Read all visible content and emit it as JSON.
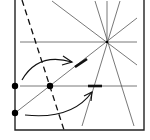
{
  "diagram": {
    "type": "origami-crease-diagram",
    "colors": {
      "background": "#ffffff",
      "frame": "#222222",
      "crease": "#555555",
      "fold_line": "#111111",
      "point": "#000000",
      "arrow": "#111111"
    },
    "frame": {
      "x1": 15,
      "y1": 0,
      "x2": 144,
      "y2": 130
    },
    "star_center": {
      "x": 107,
      "y": 42
    },
    "horizontal_lines": [
      {
        "name": "upper-horizontal-crease",
        "x1": 20,
        "y1": 42,
        "x2": 137,
        "y2": 42
      },
      {
        "name": "lower-horizontal-crease",
        "x1": 20,
        "y1": 86,
        "x2": 137,
        "y2": 86
      }
    ],
    "star_rays": [
      {
        "x1": 52,
        "y1": 1,
        "x2": 137,
        "y2": 65
      },
      {
        "x1": 137,
        "y1": 18,
        "x2": 15,
        "y2": 113
      },
      {
        "x1": 95,
        "y1": 1,
        "x2": 134,
        "y2": 126
      },
      {
        "x1": 120,
        "y1": 1,
        "x2": 82,
        "y2": 126
      },
      {
        "x1": 107,
        "y1": 1,
        "x2": 107,
        "y2": 42
      }
    ],
    "dashed_fold": {
      "x1": 22,
      "y1": 0,
      "x2": 64,
      "y2": 130
    },
    "points": [
      {
        "name": "left-upper-point",
        "x": 15,
        "y": 86
      },
      {
        "name": "left-lower-point",
        "x": 15,
        "y": 113
      },
      {
        "name": "intersection-point",
        "x": 50,
        "y": 86
      }
    ],
    "target_marks": [
      {
        "name": "diagonal-target-mark",
        "x1": 75,
        "y1": 67,
        "x2": 87,
        "y2": 59
      },
      {
        "name": "horizontal-target-mark",
        "x1": 88,
        "y1": 86,
        "x2": 102,
        "y2": 86
      }
    ],
    "arrows": [
      {
        "name": "upper-swing-arrow",
        "path": "M22,80 Q38,52 72,62",
        "head": "M63,56 L72,62 L62,65"
      },
      {
        "name": "lower-swing-arrow",
        "path": "M25,115 Q72,120 92,92",
        "head": "M84,96 L92,92 L91,101"
      }
    ]
  }
}
